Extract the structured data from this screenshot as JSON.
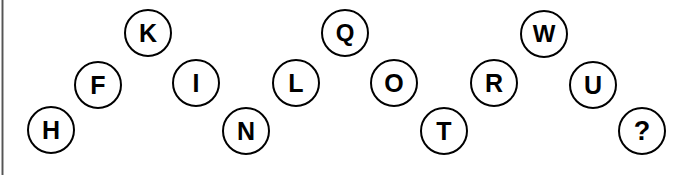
{
  "puzzle": {
    "type": "letter-sequence-circles",
    "background_color": "#ffffff",
    "circle_fill": "#ffffff",
    "circle_stroke": "#000000",
    "text_color": "#000000",
    "left_border_color": "#4a4a4a",
    "nodes": [
      {
        "label": "H",
        "x": 27,
        "y": 106,
        "row": "bottom"
      },
      {
        "label": "F",
        "x": 74,
        "y": 61,
        "row": "middle"
      },
      {
        "label": "K",
        "x": 124,
        "y": 9,
        "row": "top"
      },
      {
        "label": "I",
        "x": 172,
        "y": 59,
        "row": "middle"
      },
      {
        "label": "N",
        "x": 222,
        "y": 107,
        "row": "bottom"
      },
      {
        "label": "L",
        "x": 272,
        "y": 59,
        "row": "middle"
      },
      {
        "label": "Q",
        "x": 321,
        "y": 9,
        "row": "top"
      },
      {
        "label": "O",
        "x": 370,
        "y": 59,
        "row": "middle"
      },
      {
        "label": "T",
        "x": 420,
        "y": 107,
        "row": "bottom"
      },
      {
        "label": "R",
        "x": 470,
        "y": 59,
        "row": "middle"
      },
      {
        "label": "W",
        "x": 520,
        "y": 10,
        "row": "top"
      },
      {
        "label": "U",
        "x": 569,
        "y": 61,
        "row": "middle"
      },
      {
        "label": "?",
        "x": 618,
        "y": 107,
        "row": "bottom"
      }
    ]
  }
}
